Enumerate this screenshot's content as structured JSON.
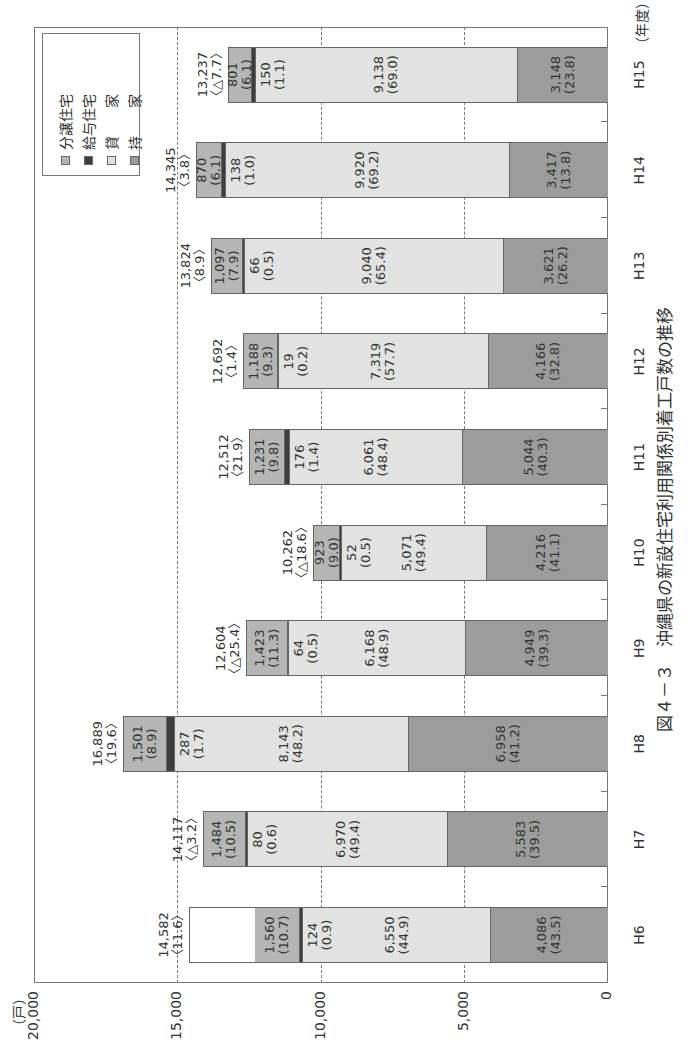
{
  "chart_data": {
    "type": "bar",
    "stacked": true,
    "orientation_on_page": "rotated 90deg counter-clockwise",
    "title": "図４－３　沖縄県の新設住宅利用関係別着工戸数の推移",
    "xlabel": "（年度）",
    "ylabel": "（戸）",
    "ylim": [
      0,
      20000
    ],
    "yticks": [
      "0",
      "5,000",
      "10,000",
      "15,000",
      "20,000"
    ],
    "grid": "dashed at 5,000 / 10,000 / 15,000",
    "legend_position": "upper right (inside plot)",
    "categories": [
      "H6",
      "H7",
      "H8",
      "H9",
      "H10",
      "H11",
      "H12",
      "H13",
      "H14",
      "H15"
    ],
    "series": [
      {
        "name": "持家",
        "color": "#9c9c9c",
        "values": [
          4086,
          5583,
          6958,
          4949,
          4216,
          5044,
          4166,
          3621,
          3417,
          3148
        ],
        "labels": [
          "4,086",
          "5,583",
          "6,958",
          "4,949",
          "4,216",
          "5,044",
          "4,166",
          "3,621",
          "3,417",
          "3,148"
        ],
        "pct": [
          "(43.5)",
          "(39.5)",
          "(41.2)",
          "(39.3)",
          "(41.1)",
          "(40.3)",
          "(32.8)",
          "(26.2)",
          "(13.8)",
          "(23.8)"
        ]
      },
      {
        "name": "貸家",
        "color": "#e2e2e2",
        "values": [
          6550,
          6970,
          8143,
          6168,
          5071,
          6061,
          7319,
          9040,
          9920,
          9138
        ],
        "labels": [
          "6,550",
          "6,970",
          "8,143",
          "6,168",
          "5,071",
          "6,061",
          "7,319",
          "9,040",
          "9,920",
          "9,138"
        ],
        "pct": [
          "(44.9)",
          "(49.4)",
          "(48.2)",
          "(48.9)",
          "(49.4)",
          "(48.4)",
          "(57.7)",
          "(65.4)",
          "(69.2)",
          "(69.0)"
        ]
      },
      {
        "name": "給与住宅",
        "color": "#3e3e3e",
        "values": [
          124,
          80,
          287,
          64,
          52,
          176,
          19,
          66,
          138,
          150
        ],
        "labels": [
          "124",
          "80",
          "287",
          "64",
          "52",
          "176",
          "19",
          "66",
          "138",
          "150"
        ],
        "pct": [
          "(0.9)",
          "(0.6)",
          "(1.7)",
          "(0.5)",
          "(0.5)",
          "(1.4)",
          "(0.2)",
          "(0.5)",
          "(1.0)",
          "(1.1)"
        ]
      },
      {
        "name": "分譲住宅",
        "color": "#b5b5b5",
        "values": [
          1560,
          1484,
          1501,
          1423,
          923,
          1231,
          1188,
          1097,
          870,
          801
        ],
        "labels": [
          "1,560",
          "1,484",
          "1,501",
          "1,423",
          "923",
          "1,231",
          "1,188",
          "1,097",
          "870",
          "801"
        ],
        "pct": [
          "(10.7)",
          "(10.5)",
          "(8.9)",
          "(11.3)",
          "(9.0)",
          "(9.8)",
          "(9.3)",
          "(7.9)",
          "(6.1)",
          "(6.1)"
        ]
      }
    ],
    "totals": [
      14582,
      14117,
      16889,
      12604,
      10262,
      12512,
      12692,
      13824,
      14345,
      13237
    ],
    "total_labels": [
      "14,582",
      "14,117",
      "16,889",
      "12,604",
      "10,262",
      "12,512",
      "12,692",
      "13,824",
      "14,345",
      "13,237"
    ],
    "change_labels": [
      "〈11.6〉",
      "〈△3.2〉",
      "〈19.6〉",
      "〈△25.4〉",
      "〈△18.6〉",
      "〈21.9〉",
      "〈1.4〉",
      "〈8.9〉",
      "〈3.8〉",
      "〈△7.7〉"
    ]
  },
  "legend": {
    "items": [
      {
        "label": "分譲住宅",
        "color": "#b5b5b5"
      },
      {
        "label": "給与住宅",
        "color": "#3e3e3e"
      },
      {
        "label": "貸　　家",
        "color": "#e2e2e2"
      },
      {
        "label": "持　　家",
        "color": "#9c9c9c"
      }
    ]
  },
  "axis": {
    "y_unit": "（戸）",
    "x_unit": "（年度）"
  },
  "caption": "図４－３　沖縄県の新設住宅利用関係別着工戸数の推移"
}
